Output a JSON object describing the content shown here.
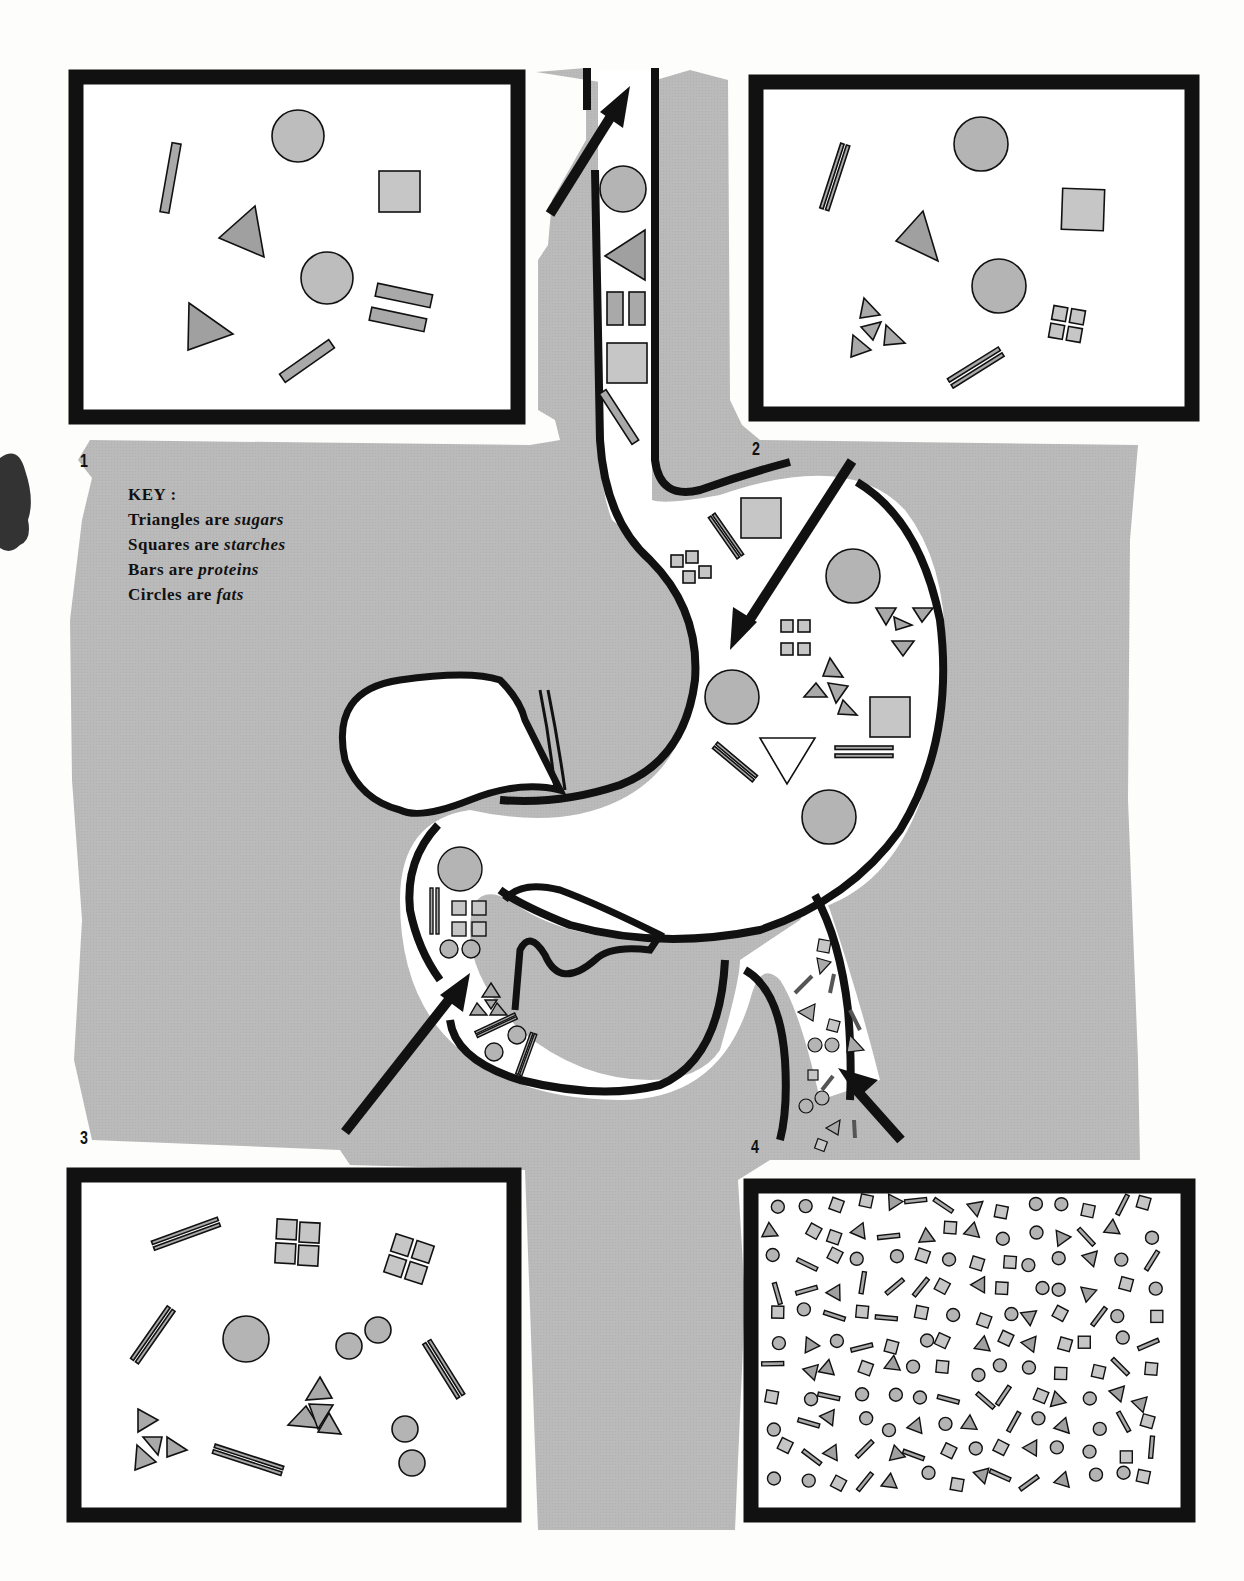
{
  "colors": {
    "background": "#fdfdfb",
    "gray_field": "#b9b9b9",
    "shape_fill": "#a9a9a9",
    "shape_fill_light": "#c4c4c4",
    "outline": "#111111"
  },
  "key": {
    "title": "KEY :",
    "items": [
      {
        "shape": "triangle",
        "prefix": "Triangles are",
        "term": "sugars"
      },
      {
        "shape": "square",
        "prefix": "Squares are",
        "term": "starches"
      },
      {
        "shape": "bar",
        "prefix": "Bars are",
        "term": "proteins"
      },
      {
        "shape": "circle",
        "prefix": "Circles are",
        "term": "fats"
      }
    ]
  },
  "panels": [
    {
      "number": "1",
      "location": "top-left",
      "contents": "whole food: circles, triangles, square, bars, double bar"
    },
    {
      "number": "2",
      "location": "top-right",
      "contents": "partly split: circles, triangle, square, split triangles, split squares, double bars"
    },
    {
      "number": "3",
      "location": "bottom-left",
      "contents": "further split: quartered squares, split triangles, small circles, double bars"
    },
    {
      "number": "4",
      "location": "bottom-right",
      "contents": "fully digested: many small circles, triangles, squares, bars"
    }
  ],
  "diagram": {
    "organs": [
      "esophagus",
      "stomach",
      "duodenum",
      "pancreas",
      "small-intestine"
    ],
    "arrows": [
      {
        "id": "esophagus-arrow",
        "direction": "up-right"
      },
      {
        "id": "stomach-arrow",
        "direction": "down-left"
      },
      {
        "id": "duodenum-arrow",
        "direction": "up-right"
      },
      {
        "id": "intestine-arrow",
        "direction": "up-left"
      }
    ]
  }
}
